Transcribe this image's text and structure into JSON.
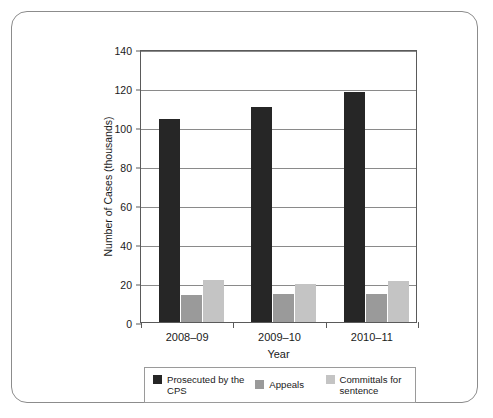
{
  "chart_data": {
    "type": "bar",
    "title": "",
    "xlabel": "Year",
    "ylabel": "Number of Cases (thousands)",
    "categories": [
      "2008–09",
      "2009–10",
      "2010–11"
    ],
    "series": [
      {
        "name": "Prosecuted by the CPS",
        "values": [
          104,
          110.5,
          118
        ],
        "color": "#262626"
      },
      {
        "name": "Appeals",
        "values": [
          14,
          14.5,
          14.5
        ],
        "color": "#9a9a9a"
      },
      {
        "name": "Committals for sentence",
        "values": [
          21.5,
          19.5,
          21
        ],
        "color": "#c4c4c4"
      }
    ],
    "ylim": [
      0,
      140
    ],
    "yticks": [
      0,
      20,
      40,
      60,
      80,
      100,
      120,
      140
    ],
    "ytick_labels": [
      "0",
      "20",
      "40",
      "60",
      "80",
      "100",
      "120",
      "140"
    ],
    "grid": true,
    "legend_position": "bottom"
  },
  "legend": {
    "items": [
      {
        "label": "Prosecuted by the CPS",
        "color": "#262626"
      },
      {
        "label": "Appeals",
        "color": "#9a9a9a"
      },
      {
        "label": "Committals for sentence",
        "color": "#c4c4c4"
      }
    ]
  }
}
